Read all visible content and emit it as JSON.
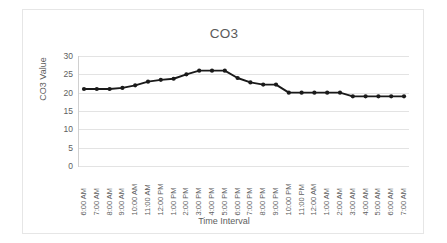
{
  "chart_data": {
    "type": "line",
    "title": "CO3",
    "xlabel": "Time Interval",
    "ylabel": "CO3 Value",
    "ylim": [
      0,
      30
    ],
    "yticks": [
      30,
      25,
      20,
      15,
      10,
      5,
      0
    ],
    "grid": true,
    "legend": "none",
    "marker": "filled-circle",
    "line_color": "#1a1a1a",
    "categories": [
      "6:00 AM",
      "7:00 AM",
      "8:00 AM",
      "9:00 AM",
      "10:00 AM",
      "11:00 AM",
      "12:00 PM",
      "1:00 PM",
      "2:00 PM",
      "3:00 PM",
      "4:00 PM",
      "5:00 PM",
      "6:00 PM",
      "7:00 PM",
      "8:00 PM",
      "9:00 PM",
      "10:00 PM",
      "11:00 PM",
      "12:00 AM",
      "1:00 AM",
      "2:00 AM",
      "3:00 AM",
      "4:00 AM",
      "5:00 AM",
      "6:00 AM",
      "7:00 AM"
    ],
    "values": [
      21,
      21,
      21,
      21.3,
      22,
      23,
      23.5,
      23.8,
      25,
      26,
      26,
      26,
      24,
      22.8,
      22.2,
      22.2,
      20,
      20,
      20,
      20,
      20,
      19,
      19,
      19,
      19,
      19
    ]
  },
  "chart": {
    "title": "CO3",
    "x_axis_title": "Time Interval",
    "y_axis_title": "CO3 Value"
  }
}
